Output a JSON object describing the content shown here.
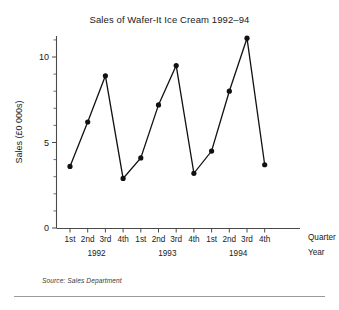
{
  "figure": {
    "title": "Sales of Wafer-It Ice Cream 1992–94",
    "source_note": "Source: Sales Department",
    "corner_labels": {
      "quarter": "Quarter",
      "year": "Year"
    }
  },
  "chart_data": {
    "type": "line",
    "title": "Sales of Wafer-It Ice Cream 1992–94",
    "xlabel": "Quarter",
    "ylabel": "Sales (£0 000s)",
    "ylim": [
      0,
      11.8
    ],
    "yticks": [
      0,
      5,
      10
    ],
    "ytick_labels": [
      "0",
      "5",
      "10"
    ],
    "minor_y_step": 1,
    "grid": false,
    "legend": null,
    "categories": [
      "1st",
      "2nd",
      "3rd",
      "4th",
      "1st",
      "2nd",
      "3rd",
      "4th",
      "1st",
      "2nd",
      "3rd",
      "4th"
    ],
    "group_labels": [
      "1992",
      "1993",
      "1994"
    ],
    "group_spans": [
      4,
      4,
      4
    ],
    "values": [
      3.6,
      6.2,
      8.9,
      2.9,
      4.1,
      7.2,
      9.5,
      3.2,
      4.5,
      8.0,
      11.1,
      3.7
    ],
    "marker": "filled-circle",
    "marker_color": "#111111",
    "line_color": "#111111",
    "series": [
      {
        "name": "Sales",
        "values": [
          3.6,
          6.2,
          8.9,
          2.9,
          4.1,
          7.2,
          9.5,
          3.2,
          4.5,
          8.0,
          11.1,
          3.7
        ]
      }
    ]
  },
  "colors": {
    "line": "#111111",
    "axis": "#4a4a4a",
    "text": "#1a1a1a",
    "rule": "#9a9a9a",
    "background": "#ffffff"
  }
}
